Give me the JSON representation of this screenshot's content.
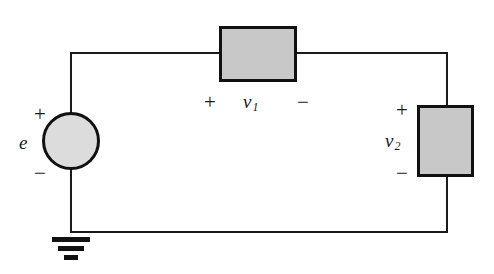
{
  "diagram": {
    "background_color": "#ffffff",
    "wire_color": "#1a1a1a",
    "box_fill_color": "#c8c8c8",
    "source_fill_color": "#dcdcdc",
    "outline_color": "#111111"
  },
  "source": {
    "name": "e",
    "label": "e",
    "plus": "+",
    "minus": "−"
  },
  "element_one": {
    "label_var": "v",
    "label_sub": "1",
    "plus": "+",
    "minus": "−"
  },
  "element_two": {
    "label_var": "v",
    "label_sub": "2",
    "plus": "+",
    "minus": "−"
  },
  "ground": {
    "label": "ground"
  }
}
